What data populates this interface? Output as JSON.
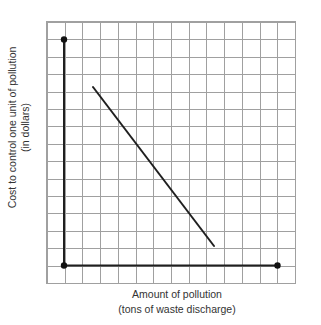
{
  "figure": {
    "width_px": 321,
    "height_px": 325,
    "background": "#ffffff"
  },
  "chart_data": {
    "type": "line",
    "title": "",
    "xlabel": "Amount of pollution",
    "xlabel_sub": "(tons of waste discharge)",
    "ylabel": "Cost to control one unit of pollution",
    "ylabel_sub": "(in dollars)",
    "x_tick_labels": [],
    "y_tick_labels": [],
    "grid": {
      "visible": true,
      "columns": 14,
      "rows": 15,
      "color": "#a0a0a0"
    },
    "axes_note": "Unscaled conceptual axes drawn one grid cell inside the frame; filled dots mark the axis endpoints",
    "axis_segments": [
      {
        "name": "y-axis",
        "x1": 64,
        "y1": 39.5,
        "x2": 64,
        "y2": 265.5
      },
      {
        "name": "x-axis",
        "x1": 64,
        "y1": 265.5,
        "x2": 277.5,
        "y2": 265.5
      }
    ],
    "endpoint_dots": [
      {
        "name": "y-axis-top-dot",
        "x": 64,
        "y": 39.5
      },
      {
        "name": "origin-dot",
        "x": 64,
        "y": 265.5
      },
      {
        "name": "x-axis-right-dot",
        "x": 277.5,
        "y": 265.5
      }
    ],
    "series": [
      {
        "name": "cost-to-control-line",
        "shape": "straight declining line from upper-left to lower-right",
        "x1": 93,
        "y1": 87,
        "x2": 214,
        "y2": 246
      }
    ],
    "colors": {
      "line": "#1f1f1f",
      "dot": "#111111",
      "grid": "#a0a0a0",
      "text": "#333333"
    }
  }
}
